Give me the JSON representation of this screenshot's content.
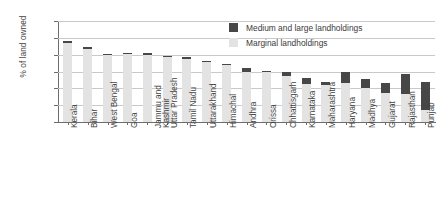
{
  "chart_data": {
    "type": "bar",
    "stacked": true,
    "title": "",
    "xlabel": "",
    "ylabel": "% of land owned",
    "ylim": [
      0,
      120
    ],
    "yticks": [
      0,
      20,
      40,
      60,
      80,
      100,
      120
    ],
    "grid": true,
    "legend_position": "top-right",
    "legend": [
      "Medium and large landholdings",
      "Marginal landholdings"
    ],
    "colors": {
      "medium_and_large": "#474747",
      "marginal": "#e3e3e3",
      "axis": "#6d6d6d",
      "grid": "#c9c9c9",
      "text": "#3f3f3f"
    },
    "categories": [
      "Kerala",
      "Bihar",
      "West Bengal",
      "Goa",
      "Jammu and Kashmir",
      "Uttar Pradesh",
      "Tamil Nadu",
      "Uttarakhand",
      "Himachal",
      "Andhra",
      "Orissa",
      "Chhattisgarh",
      "Karnataka",
      "Maharashtra",
      "Haryana",
      "Madhya",
      "Gujarat",
      "Rajasthan",
      "Punjab"
    ],
    "category_lines": [
      [
        "Kerala"
      ],
      [
        "Bihar"
      ],
      [
        "West Bengal"
      ],
      [
        "Goa"
      ],
      [
        "Jammu and",
        "Kashmir"
      ],
      [
        "Uttar Pradesh"
      ],
      [
        "Tamil Nadu"
      ],
      [
        "Uttarakhand"
      ],
      [
        "Himachal"
      ],
      [
        "Andhra"
      ],
      [
        "Orissa"
      ],
      [
        "Chhattisgarh"
      ],
      [
        "Karnataka"
      ],
      [
        "Maharashtra"
      ],
      [
        "Haryana"
      ],
      [
        "Madhya"
      ],
      [
        "Gujarat"
      ],
      [
        "Rajasthan"
      ],
      [
        "Punjab"
      ]
    ],
    "series": [
      {
        "name": "Marginal landholdings",
        "key": "marginal",
        "values": [
          94,
          87,
          80,
          81,
          80,
          78,
          75,
          71,
          68,
          60,
          60,
          55,
          45,
          44,
          46,
          41,
          35,
          33,
          14
        ]
      },
      {
        "name": "Medium and large landholdings",
        "key": "medium_and_large",
        "values": [
          2,
          2,
          1,
          1,
          1.5,
          1,
          2,
          1,
          1.5,
          4,
          1,
          4,
          7,
          4,
          14,
          10,
          11,
          24,
          34
        ]
      }
    ],
    "totals": [
      96,
      89,
      81,
      82,
      81.5,
      79,
      77,
      72,
      69.5,
      64,
      61,
      59,
      52,
      48,
      60,
      51,
      46,
      57,
      48
    ]
  }
}
